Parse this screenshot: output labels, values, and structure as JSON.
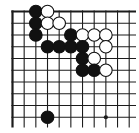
{
  "board": {
    "description": "go-corner-diagram-top-left",
    "bg_color": "#ffffff",
    "line_color": "#1c1c1c",
    "black_stone_color": "#111111",
    "white_stone_color": "#ffffff",
    "stone_outline_color": "#111111",
    "cols_visible": 11,
    "rows_visible": 10,
    "edge_top": true,
    "edge_left": true,
    "edge_right": false,
    "edge_bottom": false,
    "geometry": {
      "origin_x": 12.5,
      "origin_y": 11.5,
      "cell_w": 11.67,
      "cell_h": 11.75,
      "h_line_end_x": 136,
      "v_line_end_y": 127.5,
      "stone_radius": 6.3,
      "edge_line_width": 2.2,
      "inner_line_width": 1.1,
      "star_point_radius": 2.1
    },
    "star_points": [
      {
        "col": 9,
        "row": 10
      }
    ],
    "stones": [
      {
        "col": 3,
        "row": 1,
        "color": "black"
      },
      {
        "col": 4,
        "row": 1,
        "color": "white"
      },
      {
        "col": 3,
        "row": 2,
        "color": "black"
      },
      {
        "col": 4,
        "row": 2,
        "color": "white"
      },
      {
        "col": 5,
        "row": 2,
        "color": "white"
      },
      {
        "col": 3,
        "row": 3,
        "color": "black"
      },
      {
        "col": 6,
        "row": 3,
        "color": "black"
      },
      {
        "col": 7,
        "row": 3,
        "color": "white"
      },
      {
        "col": 8,
        "row": 3,
        "color": "white"
      },
      {
        "col": 9,
        "row": 3,
        "color": "white"
      },
      {
        "col": 4,
        "row": 4,
        "color": "black"
      },
      {
        "col": 5,
        "row": 4,
        "color": "black"
      },
      {
        "col": 6,
        "row": 4,
        "color": "black"
      },
      {
        "col": 7,
        "row": 4,
        "color": "black"
      },
      {
        "col": 9,
        "row": 4,
        "color": "white"
      },
      {
        "col": 7,
        "row": 5,
        "color": "black"
      },
      {
        "col": 8,
        "row": 5,
        "color": "white"
      },
      {
        "col": 7,
        "row": 6,
        "color": "black"
      },
      {
        "col": 8,
        "row": 6,
        "color": "black"
      },
      {
        "col": 9,
        "row": 6,
        "color": "white"
      },
      {
        "col": 4,
        "row": 10,
        "color": "black"
      }
    ]
  }
}
